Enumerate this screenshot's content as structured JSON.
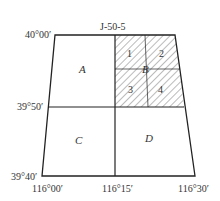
{
  "title": "J-50-5",
  "latitude_labels": {
    "top": "40°00′",
    "middle": "39°50′",
    "bottom": "39°40′"
  },
  "longitude_labels": {
    "left": "116°00′",
    "middle": "116°15′",
    "right": "116°30′"
  },
  "quadrants": {
    "A": "A",
    "B": "B",
    "C": "C",
    "D": "D"
  },
  "subdivisions_of_B": [
    "1",
    "2",
    "3",
    "4"
  ],
  "colors": {
    "line": "#222222",
    "hatch": "#555555",
    "text": "#333333"
  }
}
